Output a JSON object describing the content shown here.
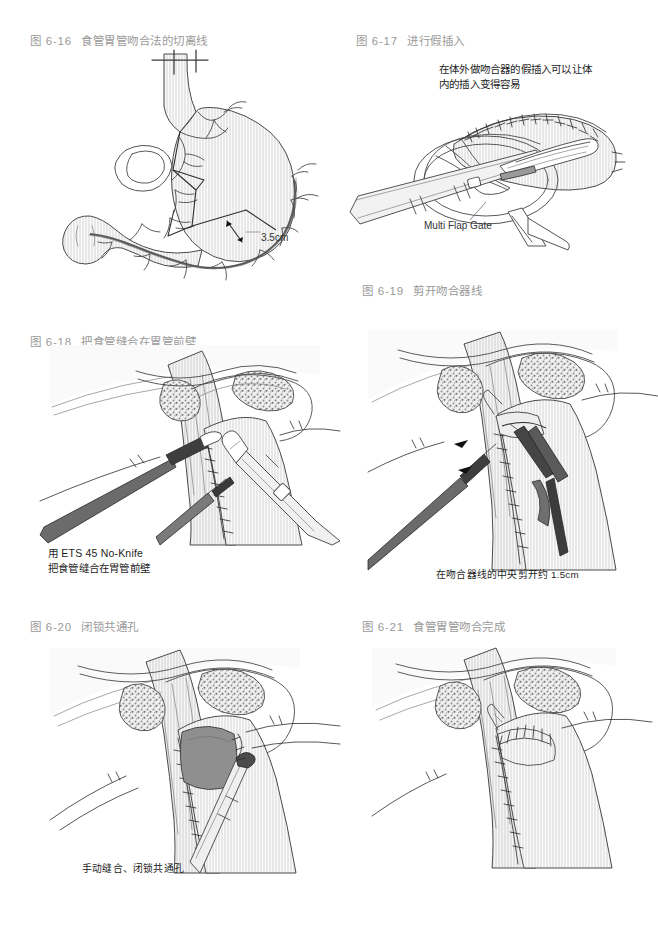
{
  "page": {
    "background_color": "#ffffff",
    "caption_color": "#9a9a9a",
    "annotation_color": "#1d1d1d",
    "width": 656,
    "height": 932,
    "kind": "surgical-atlas-page"
  },
  "figures": [
    {
      "id": "fig-6-16",
      "number": "图 6-16",
      "title": "食管胃管吻合法的切离线",
      "annotations": [
        {
          "name": "resection-distance-label",
          "text": "3.5cm"
        }
      ]
    },
    {
      "id": "fig-6-17",
      "number": "图 6-17",
      "title": "进行假插入",
      "annotations": [
        {
          "name": "dummy-insertion-note",
          "text": "在体外做吻合器的假插入可以让体\n内的插入变得容易"
        },
        {
          "name": "multi-flap-gate-label",
          "text": "Multi Flap Gate"
        }
      ]
    },
    {
      "id": "fig-6-18",
      "number": "图 6-18",
      "title": "把食管缝合在胃管前壁",
      "annotations": [
        {
          "name": "ets-stapler-note",
          "text": "用 ETS 45 No-Knife\n把食管缝合在胃管前壁"
        }
      ]
    },
    {
      "id": "fig-6-19",
      "number": "图 6-19",
      "title": "剪开吻合器线",
      "annotations": [
        {
          "name": "incision-length-note",
          "text": "在吻合器线的中央剪开约 1.5cm"
        }
      ]
    },
    {
      "id": "fig-6-20",
      "number": "图 6-20",
      "title": "闭锁共通孔",
      "annotations": [
        {
          "name": "manual-closure-note",
          "text": "手动缝合、闭锁共通孔"
        }
      ]
    },
    {
      "id": "fig-6-21",
      "number": "图 6-21",
      "title": "食管胃管吻合完成",
      "annotations": []
    }
  ]
}
